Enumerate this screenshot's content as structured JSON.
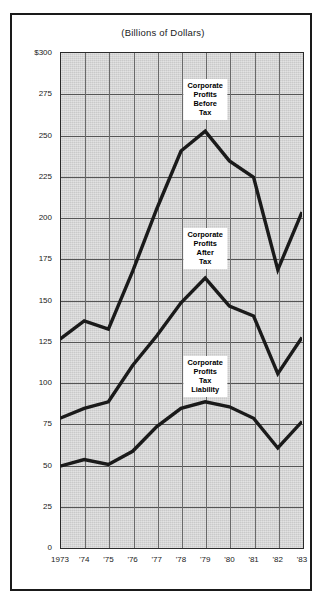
{
  "figure": {
    "title": "(Billions of Dollars)"
  },
  "chart_data": {
    "type": "line",
    "title": "(Billions of Dollars)",
    "xlabel": "",
    "ylabel": "",
    "ylim": [
      0,
      300
    ],
    "ytick_labels": [
      "$300",
      "275",
      "250",
      "225",
      "200",
      "175",
      "150",
      "125",
      "100",
      "75",
      "50",
      "25",
      "0"
    ],
    "ytick_values": [
      300,
      275,
      250,
      225,
      200,
      175,
      150,
      125,
      100,
      75,
      50,
      25,
      0
    ],
    "grid": true,
    "legend_position": "inline-annotations",
    "categories": [
      "1973",
      "'74",
      "'75",
      "'76",
      "'77",
      "'78",
      "'79",
      "'80",
      "'81",
      "'82",
      "'83"
    ],
    "x_values": [
      1973,
      1974,
      1975,
      1976,
      1977,
      1978,
      1979,
      1980,
      1981,
      1982,
      1983
    ],
    "series": [
      {
        "name": "Corporate Profits Before Tax",
        "label_text": "Corporate\nProfits\nBefore\nTax",
        "color": "#1a1a1a",
        "values": [
          126,
          137,
          132,
          167,
          205,
          240,
          252,
          234,
          224,
          168,
          203
        ]
      },
      {
        "name": "Corporate Profits After Tax",
        "label_text": "Corporate\nProfits\nAfter\nTax",
        "color": "#1a1a1a",
        "values": [
          78,
          84,
          88,
          110,
          128,
          148,
          163,
          146,
          140,
          105,
          127
        ]
      },
      {
        "name": "Corporate Profits Tax Liability",
        "label_text": "Corporate\nProfits\nTax\nLiability",
        "color": "#1a1a1a",
        "values": [
          49,
          53,
          50,
          58,
          73,
          84,
          88,
          85,
          78,
          60,
          76
        ]
      }
    ],
    "annotations": [
      {
        "text": "Corporate\nProfits\nBefore\nTax",
        "anchor_x": 1979,
        "anchor_y": 252
      },
      {
        "text": "Corporate\nProfits\nAfter\nTax",
        "anchor_x": 1979,
        "anchor_y": 163
      },
      {
        "text": "Corporate\nProfits\nTax\nLiability",
        "anchor_x": 1979,
        "anchor_y": 88
      }
    ]
  }
}
